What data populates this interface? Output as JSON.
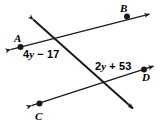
{
  "figure": {
    "type": "geometry-diagram",
    "background_color": "#ffffff",
    "stroke_color": "#1a1a1a",
    "points": [
      {
        "name": "A",
        "label": "A"
      },
      {
        "name": "B",
        "label": "B"
      },
      {
        "name": "C",
        "label": "C"
      },
      {
        "name": "D",
        "label": "D"
      }
    ],
    "angles": [
      {
        "name": "angle-1",
        "expression": "4y − 17",
        "coefficient": 4,
        "variable": "y",
        "operator": "−",
        "constant": 17,
        "operand_text": "17",
        "coef_text": "4",
        "var_text": "y"
      },
      {
        "name": "angle-2",
        "expression": "2y + 53",
        "coefficient": 2,
        "variable": "y",
        "operator": "+",
        "constant": 53,
        "operand_text": "53",
        "coef_text": "2",
        "var_text": "y"
      }
    ],
    "lines": [
      {
        "name": "line-AB",
        "through": [
          "A",
          "B"
        ],
        "arrows": "both"
      },
      {
        "name": "line-CD",
        "through": [
          "C",
          "D"
        ],
        "arrows": "both"
      },
      {
        "name": "transversal",
        "through": [],
        "arrows": "both"
      }
    ]
  }
}
